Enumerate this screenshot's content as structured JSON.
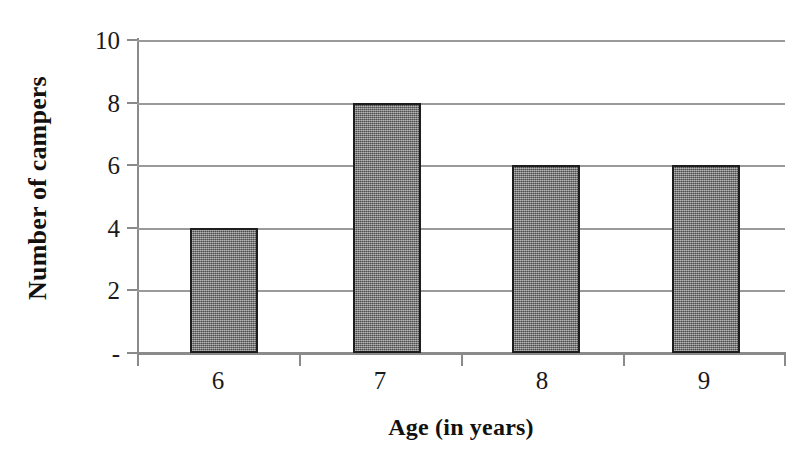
{
  "chart_data": {
    "type": "bar",
    "title": "",
    "subtitle": "",
    "xlabel": "Age (in years)",
    "ylabel": "Number of campers",
    "categories": [
      "6",
      "7",
      "8",
      "9"
    ],
    "values": [
      4,
      8,
      6,
      6
    ],
    "ylim": [
      0,
      10
    ],
    "y_ticks": [
      0,
      2,
      4,
      6,
      8,
      10
    ],
    "y_tick_labels": [
      "-",
      "2",
      "4",
      "6",
      "8",
      "10"
    ],
    "x_tick_labels": [
      "6",
      "7",
      "8",
      "9"
    ],
    "grid": "horizontal",
    "legend": "none",
    "annotations": [],
    "colors": {
      "bar_fill": "#6e6e6e",
      "bar_border": "#1d1d1d",
      "gridline": "#9a9a9a",
      "axis": "#8a8a8a",
      "text": "#111111",
      "background": "#ffffff"
    }
  }
}
